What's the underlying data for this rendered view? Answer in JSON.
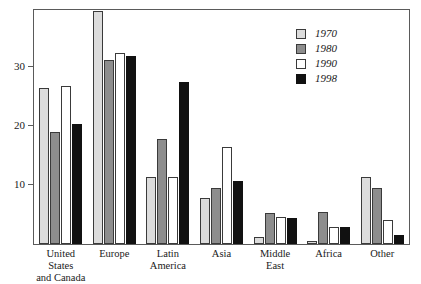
{
  "chart_data": {
    "type": "bar",
    "title": "",
    "subtitle": "",
    "xlabel": "",
    "ylabel": "",
    "ylim": [
      0,
      39.6
    ],
    "yticks": [
      10,
      20,
      30
    ],
    "ytick_labels": [
      "10",
      "20",
      "30"
    ],
    "grid": false,
    "legend_position": "top-right",
    "categories": [
      "United States\nand Canada",
      "Europe",
      "Latin\nAmerica",
      "Asia",
      "Middle\nEast",
      "Africa",
      "Other"
    ],
    "series": [
      {
        "name": "1970",
        "color": "#dcdcdc",
        "values": [
          26.4,
          39.5,
          11.4,
          7.8,
          1.2,
          0.5,
          11.4
        ]
      },
      {
        "name": "1980",
        "color": "#8d8d8d",
        "values": [
          19.0,
          31.2,
          17.8,
          9.5,
          5.3,
          5.4,
          9.5
        ]
      },
      {
        "name": "1990",
        "color": "#ffffff",
        "values": [
          26.8,
          32.4,
          11.4,
          16.4,
          4.6,
          2.9,
          4.1
        ]
      },
      {
        "name": "1998",
        "color": "#111111",
        "values": [
          20.3,
          31.9,
          27.5,
          10.7,
          4.4,
          2.9,
          1.5
        ]
      }
    ]
  },
  "legend": {
    "entries": [
      {
        "label": "1970",
        "swatch": "s1970"
      },
      {
        "label": "1980",
        "swatch": "s1980"
      },
      {
        "label": "1990",
        "swatch": "s1990"
      },
      {
        "label": "1998",
        "swatch": "s1998"
      }
    ]
  }
}
